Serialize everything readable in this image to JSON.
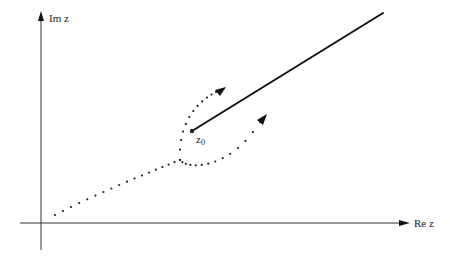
{
  "diagram": {
    "type": "complex-plane branch cut diagram",
    "axes": {
      "vertical_label": "Im z",
      "horizontal_label": "Re z"
    },
    "branch_point": {
      "label_main": "z",
      "label_sub": "0"
    },
    "elements": [
      {
        "name": "branch-cut",
        "description": "Solid ray from z0 extending up-right"
      },
      {
        "name": "path-approach",
        "description": "Dotted path from lower-left approaching the cut"
      },
      {
        "name": "path-upper",
        "description": "Dotted path passing above the branch cut, arrow pointing up-right"
      },
      {
        "name": "path-lower",
        "description": "Dotted path passing below the branch cut, arrow pointing up-right"
      }
    ]
  }
}
